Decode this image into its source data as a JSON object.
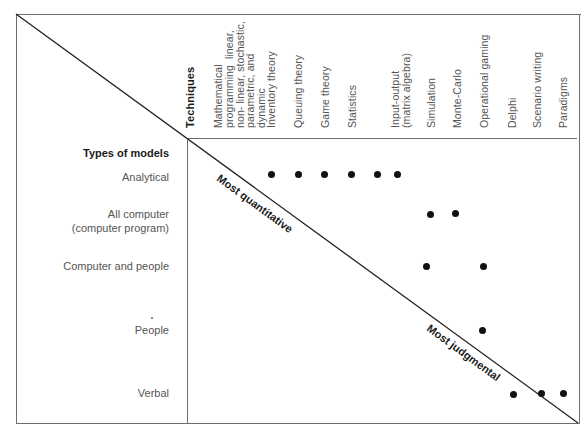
{
  "diagram": {
    "techniques_heading": "Techniques",
    "models_heading": "Types of models",
    "diagonal_labels": {
      "top": "Most quantitative",
      "bottom": "Most judgmental"
    },
    "techniques": [
      {
        "label": "Mathematical\nprogramming  linear,\nnon- linear, stochastic,\nparametric, and\ndynamic"
      },
      {
        "label": "Inventory theory"
      },
      {
        "label": "Queuing theory"
      },
      {
        "label": "Game theory"
      },
      {
        "label": "Statistics"
      },
      {
        "label": "Input-output\n(matrix algebra)"
      },
      {
        "label": "Simulation"
      },
      {
        "label": "Monte-Carlo"
      },
      {
        "label": "Operational gaming"
      },
      {
        "label": "Delphi"
      },
      {
        "label": "Scenario writing"
      },
      {
        "label": "Paradigms"
      }
    ],
    "model_types": [
      {
        "label": "Analytical"
      },
      {
        "label": "All computer\n(computer program)"
      },
      {
        "label": "Computer and people"
      },
      {
        "label": "People"
      },
      {
        "label": "Verbal"
      }
    ],
    "matrix": {
      "Analytical": [
        "Inventory theory",
        "Queuing theory",
        "Game theory",
        "Statistics",
        "Input-output (matrix algebra)",
        "Input-output (matrix algebra)"
      ],
      "All computer (computer program)": [
        "Simulation",
        "Monte-Carlo"
      ],
      "Computer and people": [
        "Simulation",
        "Operational gaming"
      ],
      "People": [
        "Operational gaming"
      ],
      "Verbal": [
        "Delphi",
        "Scenario writing",
        "Paradigms"
      ]
    },
    "line_color": "#6e6e6e",
    "dot_color": "#111111"
  }
}
